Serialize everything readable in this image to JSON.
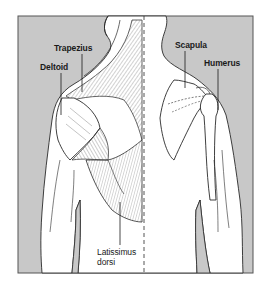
{
  "figure": {
    "colors": {
      "background_panel": "#c8c8c8",
      "body_fill": "#ffffff",
      "outline": "#2a2a2a",
      "frame": "#555555"
    },
    "labels": {
      "trapezius": "Trapezius",
      "deltoid": "Deltoid",
      "latissimus_line1": "Latissimus",
      "latissimus_line2": "dorsi",
      "scapula": "Scapula",
      "humerus": "Humerus"
    }
  }
}
